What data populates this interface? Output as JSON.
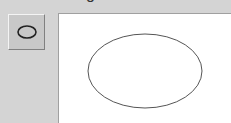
{
  "header": {
    "label_fragment": "g"
  },
  "toolbar": {
    "shape_button": {
      "icon": "ellipse-icon",
      "selected": true
    }
  },
  "canvas": {
    "shapes": [
      {
        "type": "ellipse",
        "cx": 86,
        "cy": 57,
        "rx": 57,
        "ry": 37,
        "stroke": "#555555",
        "fill": "none"
      }
    ]
  }
}
